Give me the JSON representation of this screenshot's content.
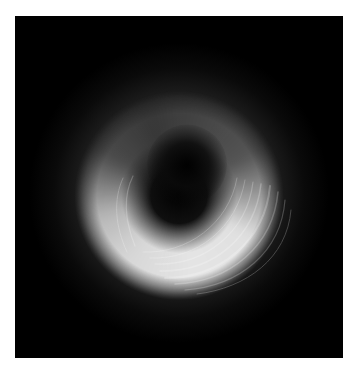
{
  "page": {
    "header_text": "",
    "background_color": "#ffffff"
  },
  "figure": {
    "panel_color": "#000000",
    "ring_color": "#e8e8e8",
    "shadow_color": "#0a0a0a"
  }
}
